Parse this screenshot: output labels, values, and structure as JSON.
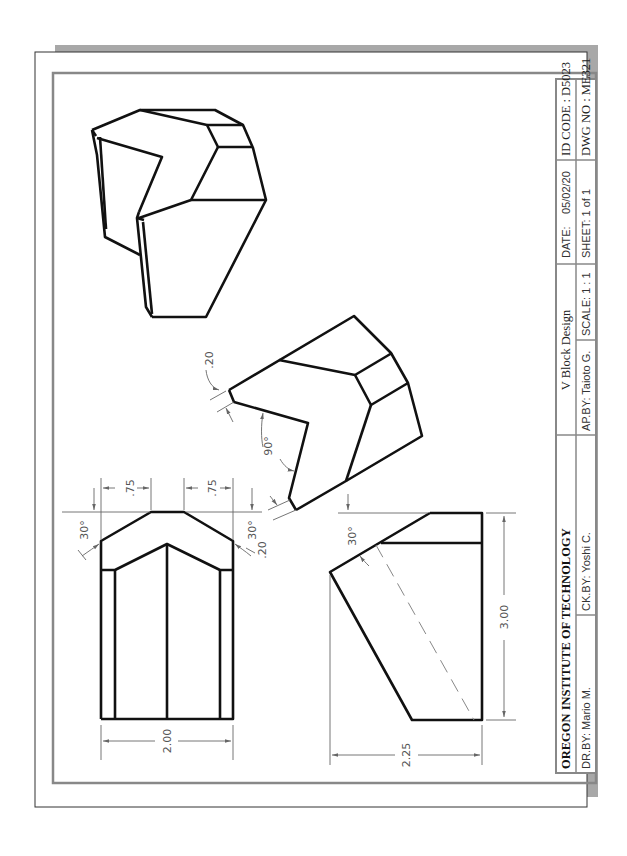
{
  "drawing": {
    "title": "V Block Design",
    "institution": "OREGON INSTITUTE OF TECHNOLOGY",
    "views": [
      "isometric-view",
      "auxiliary-view",
      "front-view",
      "side-view"
    ]
  },
  "title_block": {
    "institution": "OREGON INSTITUTE OF TECHNOLOGY",
    "title": "V Block Design",
    "date_label": "DATE:",
    "date_value": "05/02/20",
    "id_code": "ID CODE : D5023",
    "drawn_by": "DR.BY: Mario M.",
    "checked_by": "CK.BY: Yoshi C.",
    "approved_by": "AP.BY: Taioto G.",
    "scale": "SCALE: 1 : 1",
    "sheet": "SHEET:  1 of 1",
    "dwg_no": "DWG NO : ME321"
  },
  "dimensions": {
    "front_view": {
      "width": "2.00",
      "chamfer_left": ".75",
      "chamfer_right": ".75",
      "angle_left": "30°",
      "angle_right": "30°"
    },
    "auxiliary_view": {
      "v_angle": "90°",
      "flat_top": ".20",
      "flat_bottom": ".20"
    },
    "side_view": {
      "height": "3.00",
      "depth": "2.25",
      "angle": "30°"
    }
  },
  "colors": {
    "line": "#111111",
    "dimension": "#666666",
    "border": "#888888",
    "shadow": "#a8a8a8",
    "paper": "#ffffff"
  }
}
